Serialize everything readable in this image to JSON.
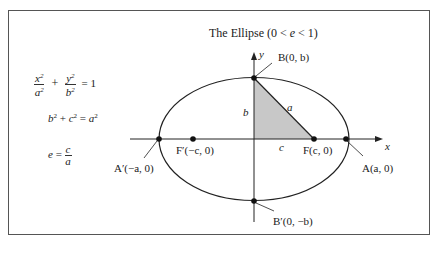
{
  "title": {
    "prefix": "The Ellipse (0 < ",
    "var": "e",
    "suffix": " < 1)"
  },
  "formulas": {
    "ellipse_equation": {
      "term1_num": "x",
      "term1_den": "a",
      "plus": "+",
      "term2_num": "y",
      "term2_den": "b",
      "rhs": "= 1"
    },
    "pythagorean": {
      "b": "b",
      "plus": " + ",
      "c": "c",
      "eq": " = ",
      "a": "a"
    },
    "eccentricity": {
      "lhs": "e",
      "eq": " = ",
      "num": "c",
      "den": "a"
    }
  },
  "axes": {
    "x_label": "x",
    "y_label": "y"
  },
  "points": {
    "B": "B(0, b)",
    "B_prime": "B′(0, −b)",
    "A": "A(a, 0)",
    "A_prime": "A′(−a, 0)",
    "F": "F(c, 0)",
    "F_prime": "F′(−c, 0)"
  },
  "triangle_labels": {
    "hypotenuse": "a",
    "vertical": "b",
    "horizontal": "c"
  },
  "colors": {
    "triangle_fill": "#c8c8c8",
    "stroke": "#222222",
    "frame": "#555555"
  }
}
